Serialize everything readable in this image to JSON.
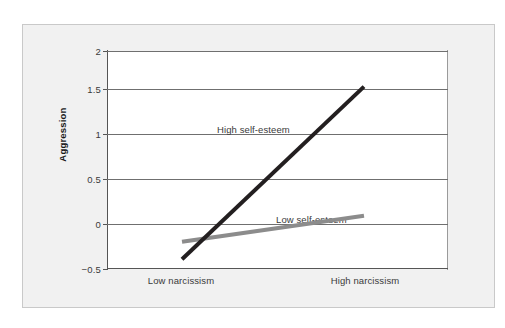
{
  "figure": {
    "panel_background": "#f1f1f1",
    "plot_background": "#ffffff",
    "border_color": "#c9c9c9"
  },
  "axes": {
    "y_title": "Aggression",
    "y_ticks": [
      "2",
      "1.5",
      "1",
      "0.5",
      "0",
      "−0.5"
    ],
    "x_categories": [
      "Low narcissism",
      "High narcissism"
    ]
  },
  "series_labels": {
    "high": "High self-esteem",
    "low": "Low self-esteem"
  },
  "colors": {
    "high_self_esteem_line": "#231f20",
    "low_self_esteem_line": "#8c8c8c",
    "gridline": "#6f6f6f",
    "axis": "#555555",
    "text": "#3a3a3a"
  },
  "chart_data": {
    "type": "line",
    "title": "",
    "xlabel": "",
    "ylabel": "Aggression",
    "categories": [
      "Low narcissism",
      "High narcissism"
    ],
    "x": [
      0,
      1
    ],
    "ylim": [
      -0.5,
      2
    ],
    "yticks": [
      -0.5,
      0,
      0.5,
      1,
      1.5,
      2
    ],
    "grid": true,
    "legend": "inline-annotation",
    "series": [
      {
        "name": "High self-esteem",
        "values": [
          -0.4,
          1.58
        ],
        "color": "#231f20",
        "linewidth": 4
      },
      {
        "name": "Low self-esteem",
        "values": [
          -0.2,
          0.1
        ],
        "color": "#8c8c8c",
        "linewidth": 4
      }
    ],
    "annotations": [
      {
        "text": "High self-esteem",
        "x": 0.37,
        "y": 1.2
      },
      {
        "text": "Low self-esteem",
        "x": 0.67,
        "y": 0.22
      }
    ]
  }
}
